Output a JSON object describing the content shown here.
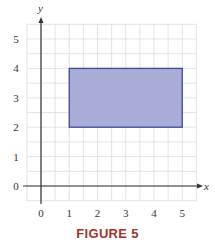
{
  "figure": {
    "caption": "FIGURE 5",
    "caption_color": "#a0342a"
  },
  "chart_data": {
    "type": "area",
    "title": "FIGURE 5",
    "xlabel": "x",
    "ylabel": "y",
    "xlim": [
      -0.5,
      5.5
    ],
    "ylim": [
      -0.5,
      5.5
    ],
    "x_ticks": [
      "0",
      "1",
      "2",
      "3",
      "4",
      "5"
    ],
    "y_ticks": [
      "0",
      "1",
      "2",
      "3",
      "4",
      "5"
    ],
    "grid": true,
    "grid_step": 0.5,
    "shapes": [
      {
        "shape": "rectangle",
        "x_range": [
          1,
          5
        ],
        "y_range": [
          2,
          4
        ],
        "fill": "#a9acd6",
        "stroke": "#3d4c9c"
      }
    ],
    "legend": null
  }
}
